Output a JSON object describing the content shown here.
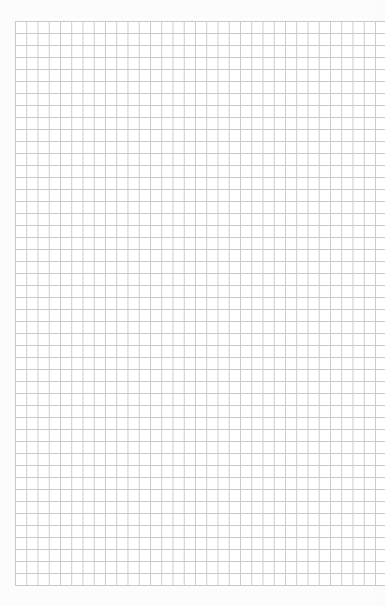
{
  "page": {
    "type": "graph-paper",
    "background_color": "#fcfcfc",
    "grid": {
      "line_color": "#c9c9c9",
      "cell_width_px": 11.25,
      "cell_height_px": 12,
      "origin": [
        15,
        21
      ],
      "rows": 47,
      "columns_visible": 32
    }
  }
}
